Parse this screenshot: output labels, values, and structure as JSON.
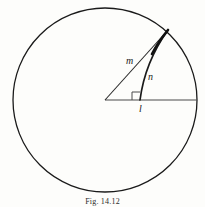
{
  "figure": {
    "caption": "Fig. 14.12",
    "background_color": "#fdfdfb",
    "stroke_color": "#1a1a1a",
    "labels": {
      "radius_label": "m",
      "arc_label": "n",
      "base_label": "l"
    },
    "geometry": {
      "circle": {
        "center_x": 105,
        "center_y": 100,
        "radius": 92
      },
      "horizontal_radius": {
        "x1": 105,
        "y1": 100,
        "x2": 197,
        "y2": 100
      },
      "slant_radius_m": {
        "x1": 105,
        "y1": 100,
        "x2": 168,
        "y2": 30
      },
      "curved_arc_n": {
        "x1": 168,
        "y1": 30,
        "x2": 140,
        "y2": 100,
        "control_x": 145,
        "control_y": 62
      },
      "right_angle_marker": {
        "x": 140,
        "y": 100,
        "size": 8
      }
    }
  }
}
